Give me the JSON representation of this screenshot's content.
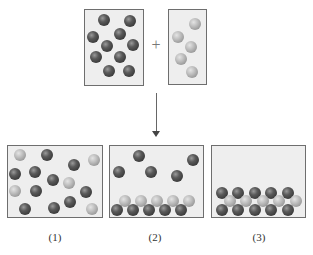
{
  "diagram": {
    "operator": "+",
    "reactants": {
      "left_box": {
        "particle": "dark",
        "count": 10
      },
      "right_box": {
        "particle": "light",
        "count": 5
      }
    },
    "arrow": "down-arrow",
    "options": [
      {
        "label": "(1)",
        "description": "dark and light particles mixed, unbonded"
      },
      {
        "label": "(2)",
        "description": "light particles layered on dark particles at bottom, extra dark particles free"
      },
      {
        "label": "(3)",
        "description": "alternating dark and light particles in a layered lattice at bottom"
      }
    ]
  },
  "colors": {
    "box_fill": "#eeeeee",
    "box_border": "#6e6e6e",
    "dark_particle": "#3a3a3a",
    "light_particle": "#b5b5b5"
  }
}
